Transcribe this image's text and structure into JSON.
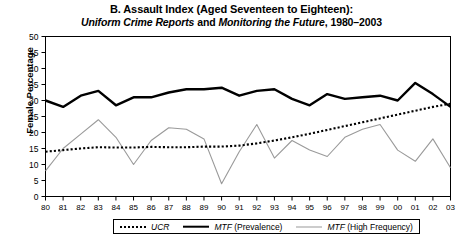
{
  "chart_data": {
    "type": "line",
    "title": "B. Assault Index (Aged Seventeen to Eighteen):",
    "subtitle_parts": {
      "part1_italic": "Uniform Crime Reports",
      "part2_plain": " and ",
      "part3_italic": "Monitoring the Future",
      "part4_plain": ", 1980–2003"
    },
    "subtitle": "Uniform Crime Reports and Monitoring the Future, 1980–2003",
    "xlabel": "",
    "ylabel": "Female Percentage",
    "ylim": [
      0,
      50
    ],
    "xlim": [
      1980,
      2003
    ],
    "ytick_labels": [
      "0",
      "5",
      "10",
      "15",
      "20",
      "25",
      "30",
      "35",
      "40",
      "45",
      "50"
    ],
    "ytick_values": [
      0,
      5,
      10,
      15,
      20,
      25,
      30,
      35,
      40,
      45,
      50
    ],
    "grid": false,
    "legend_position": "bottom",
    "categories": [
      "80",
      "81",
      "82",
      "83",
      "84",
      "85",
      "86",
      "87",
      "88",
      "89",
      "90",
      "91",
      "92",
      "93",
      "94",
      "95",
      "96",
      "97",
      "98",
      "99",
      "00",
      "01",
      "02",
      "03"
    ],
    "x": [
      1980,
      1981,
      1982,
      1983,
      1984,
      1985,
      1986,
      1987,
      1988,
      1989,
      1990,
      1991,
      1992,
      1993,
      1994,
      1995,
      1996,
      1997,
      1998,
      1999,
      2000,
      2001,
      2002,
      2003
    ],
    "series": [
      {
        "name": "UCR",
        "style": "dotted",
        "color": "#000000",
        "values": [
          14.0,
          14.5,
          15.0,
          15.4,
          15.3,
          15.3,
          15.5,
          15.4,
          15.4,
          15.6,
          15.6,
          15.9,
          16.6,
          17.5,
          18.5,
          19.6,
          20.8,
          22.0,
          23.2,
          24.4,
          25.6,
          26.8,
          28.0,
          29.0
        ]
      },
      {
        "name": "MTF (Prevalence)",
        "style": "solid-thick",
        "color": "#000000",
        "values": [
          30.0,
          28.0,
          31.5,
          33.0,
          28.5,
          31.0,
          31.0,
          32.5,
          33.5,
          33.5,
          34.0,
          31.5,
          33.0,
          33.5,
          30.5,
          28.5,
          32.0,
          30.5,
          31.0,
          31.5,
          30.0,
          35.5,
          32.0,
          28.0
        ]
      },
      {
        "name": "MTF (High Frequency)",
        "style": "solid-thin",
        "color": "#9a9a9a",
        "values": [
          8.0,
          15.0,
          19.5,
          24.0,
          18.5,
          10.0,
          17.5,
          21.5,
          21.0,
          18.0,
          4.0,
          14.0,
          22.5,
          12.0,
          17.5,
          14.5,
          12.5,
          18.5,
          21.0,
          22.5,
          14.5,
          11.0,
          18.0,
          9.0
        ]
      }
    ]
  },
  "legend": {
    "items": [
      {
        "key": "ucr",
        "label_italic": "UCR",
        "label_rest": ""
      },
      {
        "key": "prevalence",
        "label_italic": "MTF",
        "label_rest": " (Prevalence)"
      },
      {
        "key": "highfreq",
        "label_italic": "MTF",
        "label_rest": " (High Frequency)"
      }
    ]
  }
}
